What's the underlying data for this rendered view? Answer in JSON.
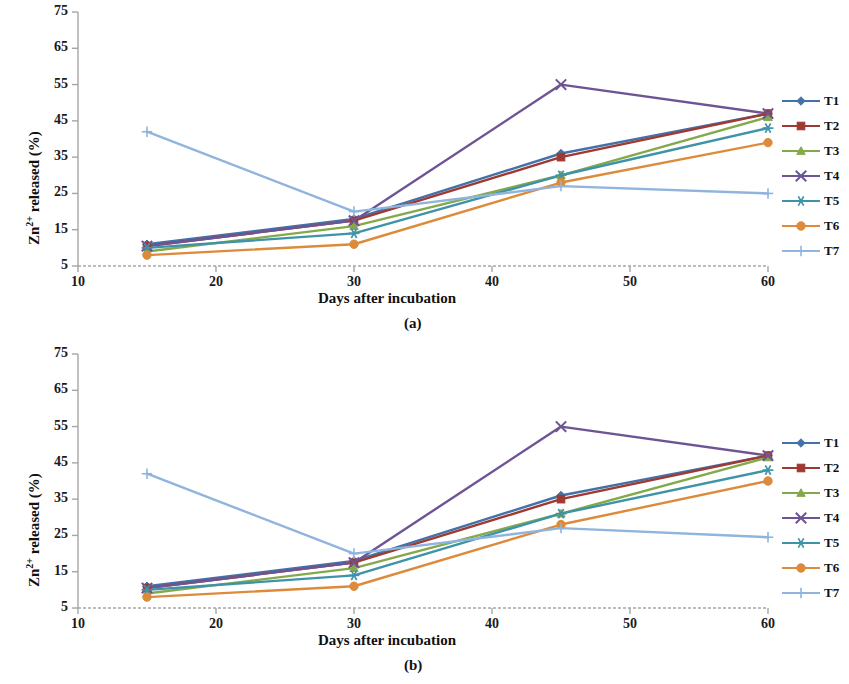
{
  "figure": {
    "panels": [
      {
        "caption": "(a)",
        "key": "a"
      },
      {
        "caption": "(b)",
        "key": "b"
      }
    ]
  },
  "axes": {
    "xlabel": "Days after incubation",
    "ylabel_prefix": "Zn",
    "ylabel_sup": "2+",
    "ylabel_suffix": " released (%)",
    "ylabel_full": "Zn2+ released (%)",
    "xticks": [
      10,
      20,
      30,
      40,
      50,
      60
    ],
    "yticks": [
      5,
      15,
      25,
      35,
      45,
      55,
      65,
      75
    ],
    "xlim": [
      10,
      60
    ],
    "ylim": [
      5,
      75
    ]
  },
  "legend": {
    "position": "right",
    "entries": [
      {
        "label": "T1",
        "color": "#4472a8",
        "marker": "diamond"
      },
      {
        "label": "T2",
        "color": "#9e3a32",
        "marker": "square"
      },
      {
        "label": "T3",
        "color": "#84a94b",
        "marker": "triangle"
      },
      {
        "label": "T4",
        "color": "#6d5494",
        "marker": "cross"
      },
      {
        "label": "T5",
        "color": "#3f93a8",
        "marker": "star"
      },
      {
        "label": "T6",
        "color": "#dd8b3b",
        "marker": "circle"
      },
      {
        "label": "T7",
        "color": "#8fb4de",
        "marker": "plus"
      }
    ]
  },
  "chart_data": [
    {
      "type": "line",
      "title": "(a)",
      "xlabel": "Days after incubation",
      "ylabel": "Zn2+ released (%)",
      "x": [
        15,
        30,
        45,
        60
      ],
      "xlim": [
        10,
        60
      ],
      "ylim": [
        5,
        75
      ],
      "grid": false,
      "legend_position": "right",
      "series": [
        {
          "name": "T1",
          "color": "#4472a8",
          "marker": "diamond",
          "values": [
            11,
            18,
            36,
            47
          ]
        },
        {
          "name": "T2",
          "color": "#9e3a32",
          "marker": "square",
          "values": [
            10.5,
            17.5,
            35,
            47
          ]
        },
        {
          "name": "T3",
          "color": "#84a94b",
          "marker": "triangle",
          "values": [
            9,
            16,
            30,
            46
          ]
        },
        {
          "name": "T4",
          "color": "#6d5494",
          "marker": "cross",
          "values": [
            10.5,
            17.5,
            55,
            47
          ]
        },
        {
          "name": "T5",
          "color": "#3f93a8",
          "marker": "star",
          "values": [
            10,
            14,
            30,
            43
          ]
        },
        {
          "name": "T6",
          "color": "#dd8b3b",
          "marker": "circle",
          "values": [
            8,
            11,
            28,
            39
          ]
        },
        {
          "name": "T7",
          "color": "#8fb4de",
          "marker": "plus",
          "values": [
            42,
            20,
            27,
            25
          ]
        }
      ]
    },
    {
      "type": "line",
      "title": "(b)",
      "xlabel": "Days after incubation",
      "ylabel": "Zn2+ released (%)",
      "x": [
        15,
        30,
        45,
        60
      ],
      "xlim": [
        10,
        60
      ],
      "ylim": [
        5,
        75
      ],
      "grid": false,
      "legend_position": "right",
      "series": [
        {
          "name": "T1",
          "color": "#4472a8",
          "marker": "diamond",
          "values": [
            11,
            18,
            36,
            47
          ]
        },
        {
          "name": "T2",
          "color": "#9e3a32",
          "marker": "square",
          "values": [
            10.5,
            17.5,
            35,
            47
          ]
        },
        {
          "name": "T3",
          "color": "#84a94b",
          "marker": "triangle",
          "values": [
            9,
            16,
            31,
            46.5
          ]
        },
        {
          "name": "T4",
          "color": "#6d5494",
          "marker": "cross",
          "values": [
            10.5,
            17.5,
            55,
            47
          ]
        },
        {
          "name": "T5",
          "color": "#3f93a8",
          "marker": "star",
          "values": [
            10,
            14,
            31,
            43
          ]
        },
        {
          "name": "T6",
          "color": "#dd8b3b",
          "marker": "circle",
          "values": [
            8,
            11,
            28,
            40
          ]
        },
        {
          "name": "T7",
          "color": "#8fb4de",
          "marker": "plus",
          "values": [
            42,
            20,
            27,
            24.5
          ]
        }
      ]
    }
  ]
}
